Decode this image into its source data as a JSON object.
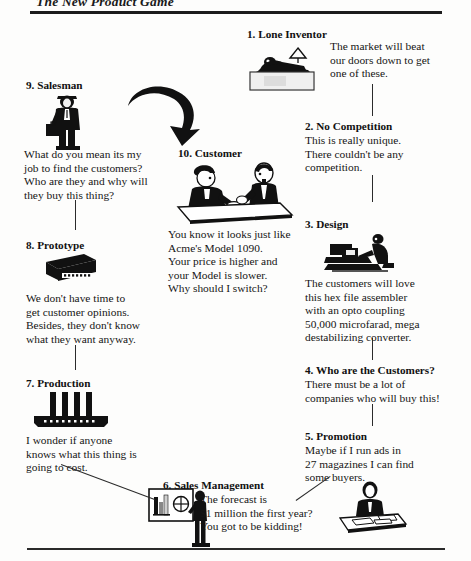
{
  "page": {
    "running_head": "The New Product Game",
    "width": 471,
    "height": 561,
    "ink_color": "#111111",
    "paper_color": "#fdfdfc"
  },
  "nodes": [
    {
      "key": "lone_inventor",
      "number": "1.",
      "title": "1. Lone Inventor",
      "quote": "The market will beat\nour doors down to get\none of these.",
      "icon": "inventor-at-desk-icon"
    },
    {
      "key": "no_competition",
      "number": "2.",
      "title": "2. No Competition",
      "quote": "This is really unique.\nThere couldn't be any\ncompetition.",
      "icon": "none"
    },
    {
      "key": "design",
      "number": "3.",
      "title": "3. Design",
      "quote": "The customers will love\nthis hex file assembler\nwith an opto coupling\n50,000 microfarad, mega\ndestabilizing converter.",
      "icon": "engineer-at-workstation-icon"
    },
    {
      "key": "who_are_the_customers",
      "number": "4.",
      "title": "4. Who are the Customers?",
      "quote": "There must be a lot of\ncompanies who will buy this!",
      "icon": "none"
    },
    {
      "key": "promotion",
      "number": "5.",
      "title": "5. Promotion",
      "quote": "Maybe if I run ads in\n27 magazines I can find\nsome buyers.",
      "icon": "person-at-desk-icon"
    },
    {
      "key": "sales_management",
      "number": "6.",
      "title": "6. Sales Management",
      "quote": "The forecast is\n$1 million the first year?\nYou got to be kidding!",
      "icon": "presenter-with-chart-board-icon"
    },
    {
      "key": "production",
      "number": "7.",
      "title": "7. Production",
      "quote": "I wonder if anyone\nknows what this thing is\ngoing to cost.",
      "icon": "factory-machine-icon"
    },
    {
      "key": "prototype",
      "number": "8.",
      "title": "8. Prototype",
      "quote": "We don't have time to\nget customer opinions.\nBesides, they don't know\nwhat they want anyway.",
      "icon": "prototype-box-icon"
    },
    {
      "key": "salesman",
      "number": "9.",
      "title": "9. Salesman",
      "quote": "What do you mean its my\njob to find the customers?\nWho are they and why will\nthey buy this thing?",
      "icon": "salesman-with-briefcase-icon"
    },
    {
      "key": "customer",
      "number": "10.",
      "title": "10. Customer",
      "quote": "You know it looks just like\nAcme's Model 1090.\nYour price is higher and\nyour Model is slower.\nWhy should I switch?",
      "icon": "two-people-at-table-icon"
    }
  ],
  "connectors": [
    {
      "name": "inventor-to-no-competition",
      "type": "vertical"
    },
    {
      "name": "no-competition-to-design",
      "type": "vertical"
    },
    {
      "name": "design-to-customers",
      "type": "vertical"
    },
    {
      "name": "customers-to-promotion",
      "type": "vertical"
    },
    {
      "name": "promotion-to-sales-management",
      "type": "diagonal"
    },
    {
      "name": "sales-management-to-production",
      "type": "diagonal"
    },
    {
      "name": "production-to-prototype",
      "type": "vertical"
    },
    {
      "name": "prototype-to-salesman",
      "type": "vertical"
    },
    {
      "name": "salesman-to-customer",
      "type": "curved-arrow"
    }
  ]
}
